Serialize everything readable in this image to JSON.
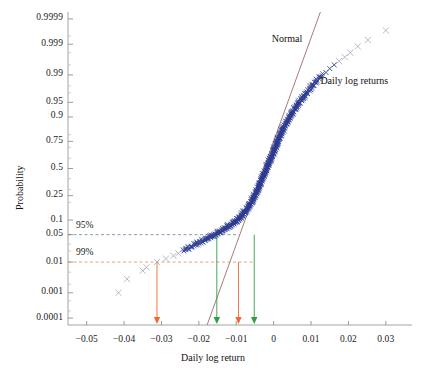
{
  "chart_data": {
    "type": "scatter",
    "title": "",
    "xlabel": "Daily log return",
    "ylabel": "Probability",
    "xlim": [
      -0.055,
      0.037
    ],
    "ylim_probability": [
      5e-05,
      0.99995
    ],
    "grid": false,
    "axis_scale_y": "normal-probability",
    "xticks": [
      -0.05,
      -0.04,
      -0.03,
      -0.02,
      -0.01,
      0,
      0.01,
      0.02,
      0.03
    ],
    "xtick_labels": [
      "−0.05",
      "−0.04",
      "−0.03",
      "−0.02",
      "−0.01",
      "0",
      "0.01",
      "0.02",
      "0.03"
    ],
    "yticks": [
      0.0001,
      0.001,
      0.01,
      0.05,
      0.1,
      0.25,
      0.5,
      0.75,
      0.9,
      0.95,
      0.99,
      0.999,
      0.9999
    ],
    "ytick_labels": [
      "0.0001",
      "0.001",
      "0.01",
      "0.05",
      "0.1",
      "0.25",
      "0.5",
      "0.75",
      "0.9",
      "0.95",
      "0.99",
      "0.999",
      "0.9999"
    ],
    "series": [
      {
        "name": "Daily log returns",
        "marker": "x",
        "color": "#2b3a8f",
        "tail_color": "#9aa2b8",
        "points_xy": [
          [
            -0.0415,
            0.001
          ],
          [
            -0.0392,
            0.003
          ],
          [
            -0.035,
            0.0055
          ],
          [
            -0.034,
            0.007
          ],
          [
            -0.0312,
            0.01
          ],
          [
            -0.0288,
            0.0125
          ],
          [
            -0.0268,
            0.015
          ],
          [
            -0.0255,
            0.0175
          ],
          [
            -0.024,
            0.02
          ],
          [
            -0.0228,
            0.0225
          ],
          [
            -0.0218,
            0.0255
          ],
          [
            -0.0208,
            0.0285
          ],
          [
            -0.0199,
            0.031
          ],
          [
            -0.019,
            0.034
          ],
          [
            -0.0182,
            0.037
          ],
          [
            -0.0175,
            0.04
          ],
          [
            -0.0168,
            0.043
          ],
          [
            -0.016,
            0.046
          ],
          [
            -0.0154,
            0.049
          ],
          [
            -0.0148,
            0.052
          ],
          [
            -0.0142,
            0.056
          ],
          [
            -0.0136,
            0.06
          ],
          [
            -0.013,
            0.064
          ],
          [
            -0.0125,
            0.068
          ],
          [
            -0.012,
            0.072
          ],
          [
            -0.0115,
            0.076
          ],
          [
            -0.011,
            0.08
          ],
          [
            -0.0106,
            0.0845
          ],
          [
            -0.0102,
            0.089
          ],
          [
            -0.0098,
            0.0935
          ],
          [
            -0.0094,
            0.098
          ],
          [
            -0.009,
            0.105
          ],
          [
            -0.0086,
            0.112
          ],
          [
            -0.0082,
            0.12
          ],
          [
            -0.0079,
            0.128
          ],
          [
            -0.0075,
            0.136
          ],
          [
            -0.0072,
            0.145
          ],
          [
            -0.0069,
            0.155
          ],
          [
            -0.0066,
            0.165
          ],
          [
            -0.0063,
            0.176
          ],
          [
            -0.006,
            0.187
          ],
          [
            -0.0057,
            0.199
          ],
          [
            -0.0055,
            0.211
          ],
          [
            -0.0052,
            0.224
          ],
          [
            -0.005,
            0.237
          ],
          [
            -0.0048,
            0.25
          ],
          [
            -0.0045,
            0.265
          ],
          [
            -0.0043,
            0.28
          ],
          [
            -0.0041,
            0.295
          ],
          [
            -0.0039,
            0.31
          ],
          [
            -0.0037,
            0.326
          ],
          [
            -0.0035,
            0.342
          ],
          [
            -0.0033,
            0.358
          ],
          [
            -0.0031,
            0.375
          ],
          [
            -0.0029,
            0.392
          ],
          [
            -0.0027,
            0.409
          ],
          [
            -0.0025,
            0.426
          ],
          [
            -0.0023,
            0.443
          ],
          [
            -0.0021,
            0.46
          ],
          [
            -0.0019,
            0.478
          ],
          [
            -0.0017,
            0.495
          ],
          [
            -0.0015,
            0.512
          ],
          [
            -0.0013,
            0.53
          ],
          [
            -0.0011,
            0.547
          ],
          [
            -0.0009,
            0.565
          ],
          [
            -0.0007,
            0.582
          ],
          [
            -0.0005,
            0.6
          ],
          [
            -0.0003,
            0.617
          ],
          [
            -0.0001,
            0.634
          ],
          [
            0.0001,
            0.651
          ],
          [
            0.0003,
            0.668
          ],
          [
            0.0005,
            0.685
          ],
          [
            0.0007,
            0.701
          ],
          [
            0.0009,
            0.717
          ],
          [
            0.0011,
            0.733
          ],
          [
            0.0013,
            0.748
          ],
          [
            0.0015,
            0.763
          ],
          [
            0.0017,
            0.777
          ],
          [
            0.002,
            0.791
          ],
          [
            0.0022,
            0.805
          ],
          [
            0.0024,
            0.818
          ],
          [
            0.0027,
            0.83
          ],
          [
            0.0029,
            0.842
          ],
          [
            0.0032,
            0.854
          ],
          [
            0.0035,
            0.865
          ],
          [
            0.0038,
            0.876
          ],
          [
            0.0041,
            0.886
          ],
          [
            0.0044,
            0.895
          ],
          [
            0.0047,
            0.904
          ],
          [
            0.0051,
            0.912
          ],
          [
            0.0054,
            0.92
          ],
          [
            0.0058,
            0.928
          ],
          [
            0.0062,
            0.935
          ],
          [
            0.0066,
            0.942
          ],
          [
            0.007,
            0.948
          ],
          [
            0.0075,
            0.954
          ],
          [
            0.008,
            0.959
          ],
          [
            0.0085,
            0.964
          ],
          [
            0.009,
            0.969
          ],
          [
            0.0096,
            0.973
          ],
          [
            0.0102,
            0.977
          ],
          [
            0.0108,
            0.9805
          ],
          [
            0.0115,
            0.984
          ],
          [
            0.0122,
            0.987
          ],
          [
            0.013,
            0.9895
          ],
          [
            0.014,
            0.9915
          ],
          [
            0.015,
            0.9935
          ],
          [
            0.0162,
            0.995
          ],
          [
            0.0175,
            0.9962
          ],
          [
            0.019,
            0.9972
          ],
          [
            0.0205,
            0.998
          ],
          [
            0.0225,
            0.9988
          ],
          [
            0.0252,
            0.9993
          ],
          [
            0.03,
            0.9997
          ]
        ]
      },
      {
        "name": "Normal",
        "type": "reference-line",
        "color": "#9e6b6b",
        "x_from": -0.0178,
        "x_to": 0.0125,
        "p_from": 5e-05,
        "p_to": 0.99995
      }
    ],
    "annotations": [
      {
        "text": "Normal",
        "x": -0.0005,
        "p_anchor": 0.9993
      },
      {
        "text": "Daily log returns",
        "x": 0.0125,
        "p_anchor": 0.984
      }
    ],
    "threshold_lines": [
      {
        "label": "95%",
        "probability": 0.05,
        "color": "#6b7fa3",
        "style": "dashed",
        "x_end": -0.0093
      },
      {
        "label": "99%",
        "probability": 0.01,
        "color": "#e08a54",
        "style": "dashed",
        "x_end": -0.0052
      }
    ],
    "var_markers": [
      {
        "name": "empirical-99",
        "x": -0.0312,
        "color": "#ef6a33",
        "from_probability": 0.01
      },
      {
        "name": "empirical-95",
        "x": -0.0152,
        "color": "#2f9e3f",
        "from_probability": 0.05
      },
      {
        "name": "normal-99",
        "x": -0.0094,
        "color": "#ef6a33",
        "from_probability": 0.01
      },
      {
        "name": "normal-95",
        "x": -0.0052,
        "color": "#2f9e3f",
        "from_probability": 0.05
      }
    ]
  }
}
